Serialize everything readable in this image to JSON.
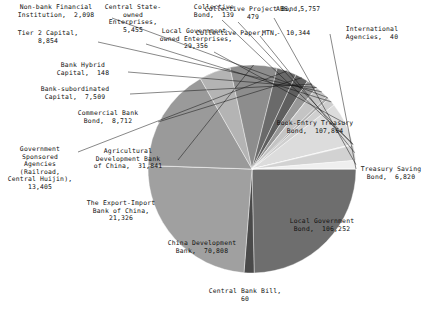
{
  "chart_data": {
    "type": "pie",
    "title": "",
    "xlabel": "",
    "ylabel": "",
    "legend_position": "none",
    "grid": false,
    "units": "100 million CNY",
    "total": 403244,
    "categories": [
      "Book-Entry Treasury Bond",
      "Treasury Saving Bond",
      "Local Government Bond",
      "Central Bank Bill",
      "China Development Bank",
      "The Export-Import Bank of China",
      "Agricultural Development Bank of China",
      "Government Sponsored Agencies (Railroad, Central Huijin)",
      "Commercial Bank Bond",
      "Bank-subordinated Capital",
      "Bank Hybrid Capital",
      "Tier 2 Capital",
      "Non-bank Financial Institution",
      "Central State-owned Enterprises",
      "Local Government-owned Enterprises",
      "Collective Bond",
      "Collective Paper",
      "MTN",
      "ABS",
      "International Agencies"
    ],
    "values": [
      107864,
      6820,
      106252,
      60,
      70808,
      21326,
      31841,
      13405,
      8712,
      7509,
      148,
      8854,
      2098,
      5455,
      29356,
      139,
      479,
      10344,
      5757,
      40
    ],
    "colors": [
      "#6e6e6e",
      "#4a4a4a",
      "#a0a0a0",
      "#8b8b8b",
      "#9a9a9a",
      "#b4b4b4",
      "#8d8d8d",
      "#6a6a6a",
      "#5f5f5f",
      "#989898",
      "#707070",
      "#c4c4c4",
      "#b0b0b0",
      "#cfcfcf",
      "#dcdcdc",
      "#c8c8c8",
      "#e4e4e4",
      "#d2d2d2",
      "#efefef",
      "#bcbcbc"
    ],
    "slices": [
      {
        "label": "Book-Entry Treasury Bond",
        "value": 107864,
        "value_text": "107,864",
        "color": "#6e6e6e"
      },
      {
        "label": "Treasury Saving Bond",
        "value": 6820,
        "value_text": "6,820",
        "color": "#4a4a4a"
      },
      {
        "label": "Local Government Bond",
        "value": 106252,
        "value_text": "106,252",
        "color": "#a0a0a0"
      },
      {
        "label": "Central Bank Bill",
        "value": 60,
        "value_text": "60",
        "color": "#8b8b8b"
      },
      {
        "label": "China Development Bank",
        "value": 70808,
        "value_text": "70,808",
        "color": "#9a9a9a"
      },
      {
        "label": "The Export-Import Bank of China",
        "value": 21326,
        "value_text": "21,326",
        "color": "#b4b4b4"
      },
      {
        "label": "Agricultural Development Bank of China",
        "value": 31841,
        "value_text": "31,841",
        "color": "#8d8d8d"
      },
      {
        "label": "Government Sponsored Agencies (Railroad, Central Huijin)",
        "value": 13405,
        "value_text": "13,405",
        "color": "#6a6a6a"
      },
      {
        "label": "Commercial Bank Bond",
        "value": 8712,
        "value_text": "8,712",
        "color": "#5f5f5f"
      },
      {
        "label": "Bank-subordinated Capital",
        "value": 7509,
        "value_text": "7,509",
        "color": "#989898"
      },
      {
        "label": "Bank Hybrid Capital",
        "value": 148,
        "value_text": "148",
        "color": "#707070"
      },
      {
        "label": "Tier 2 Capital",
        "value": 8854,
        "value_text": "8,854",
        "color": "#c4c4c4"
      },
      {
        "label": "Non-bank Financial Institution",
        "value": 2098,
        "value_text": "2,098",
        "color": "#b0b0b0"
      },
      {
        "label": "Central State-owned Enterprises",
        "value": 5455,
        "value_text": "5,455",
        "color": "#cfcfcf"
      },
      {
        "label": "Local Government-owned Enterprises",
        "value": 29356,
        "value_text": "29,356",
        "color": "#dcdcdc"
      },
      {
        "label": "Collective Bond",
        "value": 139,
        "value_text": "139",
        "color": "#c8c8c8"
      },
      {
        "label": "Collective Project Bond",
        "value": 479,
        "value_text": "479",
        "color": "#e4e4e4"
      },
      {
        "label": "MTN",
        "value": 10344,
        "value_text": "10,344",
        "color": "#d2d2d2"
      },
      {
        "label": "ABS",
        "value": 5757,
        "value_text": "5,757",
        "color": "#efefef"
      },
      {
        "label": "International Agencies",
        "value": 40,
        "value_text": "40",
        "color": "#bcbcbc"
      }
    ]
  },
  "labels": {
    "non_bank_financial": "Non-bank Financial\nInstitution,  2,098",
    "tier2_capital": "Tier 2 Capital,\n8,854",
    "bank_hybrid_capital": "Bank Hybrid\nCapital,  148",
    "bank_subordinated_capital": "Bank-subordinated\nCapital,  7,509",
    "commercial_bank_bond": "Commercial Bank\nBond,  8,712",
    "gov_sponsored_agencies": "Government\nSponsored\nAgencies\n(Railroad,\nCentral Huijin),\n13,405",
    "agricultural_development_bank": "Agricultural\nDevelopment Bank\nof China,  31,841",
    "export_import_bank": "The Export-Import\nBank of China,\n21,326",
    "china_development_bank": "China Development\nBank,  70,808",
    "central_bank_bill": "Central Bank Bill,\n60",
    "local_government_bond": "Local Government\nBond,  106,252",
    "treasury_saving_bond": "Treasury Saving\nBond,  6,820",
    "book_entry_treasury_bond": "Book-Entry Treasury\nBond,  107,864",
    "central_state_owned": "Central State-\nowned\nEnterprises,\n5,455",
    "local_gov_owned": "Local Government-\nowned Enterprises,\n29,356",
    "collective_bond": "Collective\nBond,  139",
    "collective_project_bond": "Collective Project Bond,\n479",
    "collective_paper": "Collective Paper,   -",
    "mtn": "MTN,  10,344",
    "abs": "ABS,  5,757",
    "international_agencies": "International\nAgencies,  40"
  }
}
